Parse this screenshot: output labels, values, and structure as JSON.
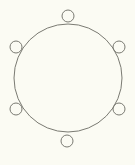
{
  "diagram": {
    "background": "#fbfbf3",
    "stroke_color": "#7a7a72",
    "table": {
      "cx": 68,
      "cy": 78,
      "r": 54
    },
    "seats": [
      {
        "name": "seat-top",
        "cx": 68,
        "cy": 16,
        "r": 6
      },
      {
        "name": "seat-top-right",
        "cx": 119,
        "cy": 47,
        "r": 6
      },
      {
        "name": "seat-bottom-right",
        "cx": 119,
        "cy": 109,
        "r": 6
      },
      {
        "name": "seat-bottom",
        "cx": 67,
        "cy": 141,
        "r": 6
      },
      {
        "name": "seat-bottom-left",
        "cx": 16,
        "cy": 109,
        "r": 6
      },
      {
        "name": "seat-top-left",
        "cx": 16,
        "cy": 47,
        "r": 6
      }
    ]
  }
}
